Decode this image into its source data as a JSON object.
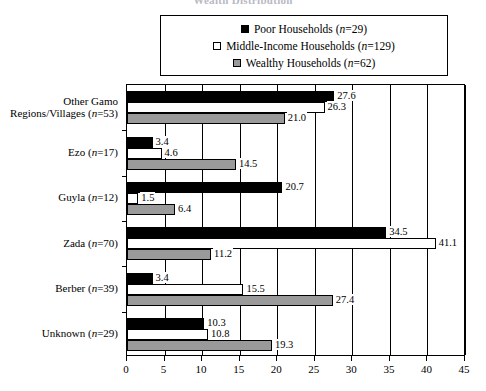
{
  "title": "Wealth Distribution",
  "legend": {
    "position": "top-center",
    "entries": [
      {
        "label": "Poor Households (",
        "n_prefix": "n",
        "n_value": "=29)",
        "swatch": "black",
        "name": "poor-households"
      },
      {
        "label": "Middle-Income Households (",
        "n_prefix": "n",
        "n_value": "=129)",
        "swatch": "white",
        "name": "middle-income-households"
      },
      {
        "label": "Wealthy Households (",
        "n_prefix": "n",
        "n_value": "=62)",
        "swatch": "gray",
        "name": "wealthy-households"
      }
    ]
  },
  "colors": {
    "poor": "#000000",
    "middle": "#ffffff",
    "wealthy": "#9a9a9a",
    "axis": "#000000",
    "background": "#ffffff"
  },
  "chart_data": {
    "type": "bar",
    "orientation": "horizontal",
    "title": "Wealth Distribution",
    "xlabel": "",
    "ylabel": "",
    "xlim": [
      0,
      45
    ],
    "xticks": [
      0,
      5,
      10,
      15,
      20,
      25,
      30,
      35,
      40,
      45
    ],
    "grid": true,
    "grid_axis": "x",
    "categories": [
      "Other Gamo Regions/Villages (n=53)",
      "Ezo (n=17)",
      "Guyla (n=12)",
      "Zada (n=70)",
      "Berber (n=39)",
      "Unknown (n=29)"
    ],
    "category_lines": [
      [
        "Other Gamo",
        "Regions/Villages (",
        "n",
        "=53)"
      ],
      [
        "",
        "Ezo (",
        "n",
        "=17)"
      ],
      [
        "",
        "Guyla (",
        "n",
        "=12)"
      ],
      [
        "",
        "Zada (",
        "n",
        "=70)"
      ],
      [
        "",
        "Berber (",
        "n",
        "=39)"
      ],
      [
        "",
        "Unknown (",
        "n",
        "=29)"
      ]
    ],
    "series": [
      {
        "name": "Poor Households (n=29)",
        "key": "poor",
        "values": [
          27.6,
          3.4,
          20.7,
          34.5,
          3.4,
          10.3
        ]
      },
      {
        "name": "Middle-Income Households (n=129)",
        "key": "mid",
        "values": [
          26.3,
          4.6,
          1.5,
          41.1,
          15.5,
          10.8
        ]
      },
      {
        "name": "Wealthy Households (n=62)",
        "key": "wealthy",
        "values": [
          21.0,
          14.5,
          6.4,
          11.2,
          27.4,
          19.3
        ]
      }
    ],
    "labels": {
      "poor": [
        "27.6",
        "3.4",
        "20.7",
        "34.5",
        "3.4",
        "10.3"
      ],
      "mid": [
        "26.3",
        "4.6",
        "1.5",
        "41.1",
        "15.5",
        "10.8"
      ],
      "wealthy": [
        "21.0",
        "14.5",
        "6.4",
        "11.2",
        "27.4",
        "19.3"
      ]
    }
  }
}
